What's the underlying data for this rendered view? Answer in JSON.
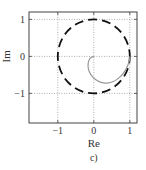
{
  "chart_data": {
    "type": "line",
    "title": "",
    "caption": "c)",
    "xlabel": "Re",
    "ylabel": "Im",
    "xlim": [
      -1.8,
      1.2
    ],
    "ylim": [
      -1.8,
      1.2
    ],
    "xticks": [
      -1,
      0,
      1
    ],
    "yticks": [
      -1,
      0,
      1
    ],
    "xtick_labels": [
      "−1",
      "0",
      "1"
    ],
    "ytick_labels": [
      "−1",
      "0",
      "1"
    ],
    "grid": true,
    "grid_style": "dotted",
    "legend": null,
    "series": [
      {
        "name": "unit circle",
        "style": "dashed",
        "color": "#111111",
        "shape": "circle",
        "center": [
          0,
          0
        ],
        "radius": 1
      },
      {
        "name": "trajectory",
        "style": "solid",
        "color": "#999999",
        "points": [
          [
            0.0,
            0.0
          ],
          [
            -0.08,
            -0.03
          ],
          [
            -0.14,
            -0.12
          ],
          [
            -0.16,
            -0.25
          ],
          [
            -0.13,
            -0.4
          ],
          [
            -0.05,
            -0.53
          ],
          [
            0.07,
            -0.64
          ],
          [
            0.22,
            -0.71
          ],
          [
            0.38,
            -0.72
          ],
          [
            0.54,
            -0.68
          ],
          [
            0.7,
            -0.58
          ],
          [
            0.84,
            -0.43
          ],
          [
            0.94,
            -0.25
          ],
          [
            0.99,
            -0.1
          ],
          [
            1.0,
            0.0
          ]
        ]
      }
    ]
  }
}
